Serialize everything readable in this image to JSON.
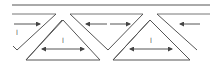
{
  "diagram": {
    "type": "zigzag-strip-with-triangles",
    "labels": {
      "left_panel": "l",
      "triangle_1": "l",
      "triangle_2": "l"
    },
    "arrows": [
      {
        "position": "left-top-row",
        "direction": "right"
      },
      {
        "position": "center-top-row-1",
        "direction": "left"
      },
      {
        "position": "triangle-1-base",
        "direction": "both"
      },
      {
        "position": "center-top-row-2",
        "direction": "right"
      },
      {
        "position": "triangle-2-base",
        "direction": "both"
      },
      {
        "position": "right-top-row",
        "direction": "left"
      }
    ],
    "colors": {
      "line": "#555555",
      "background": "#ffffff"
    }
  }
}
